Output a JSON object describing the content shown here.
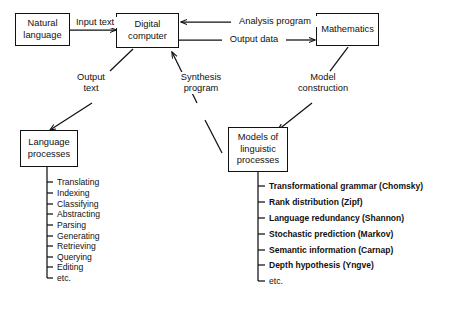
{
  "diagram": {
    "nodes": [
      {
        "id": "natural-language",
        "label": "Natural\nlanguage"
      },
      {
        "id": "digital-computer",
        "label": "Digital\ncomputer"
      },
      {
        "id": "mathematics",
        "label": "Mathematics"
      },
      {
        "id": "language-processes",
        "label": "Language\nprocesses"
      },
      {
        "id": "models-linguistic",
        "label": "Models of\nlinguistic\nprocesses"
      }
    ],
    "edge_labels": [
      {
        "id": "input-text",
        "label": "Input text"
      },
      {
        "id": "analysis-program",
        "label": "Analysis program"
      },
      {
        "id": "output-data",
        "label": "Output data"
      },
      {
        "id": "output-text",
        "label": "Output\ntext"
      },
      {
        "id": "synthesis-program",
        "label": "Synthesis\nprogram"
      },
      {
        "id": "model-construction",
        "label": "Model\nconstruction"
      }
    ],
    "language_processes_list": [
      "Translating",
      "Indexing",
      "Classifying",
      "Abstracting",
      "Parsing",
      "Generating",
      "Retrieving",
      "Querying",
      "Editing",
      "etc."
    ],
    "models_list": [
      "Transformational grammar (Chomsky)",
      "Rank distribution (Zipf)",
      "Language redundancy (Shannon)",
      "Stochastic prediction (Markov)",
      "Semantic information (Carnap)",
      "Depth hypothesis (Yngve)",
      "etc."
    ],
    "colors": {
      "ink": "#111111",
      "background": "#ffffff"
    }
  }
}
